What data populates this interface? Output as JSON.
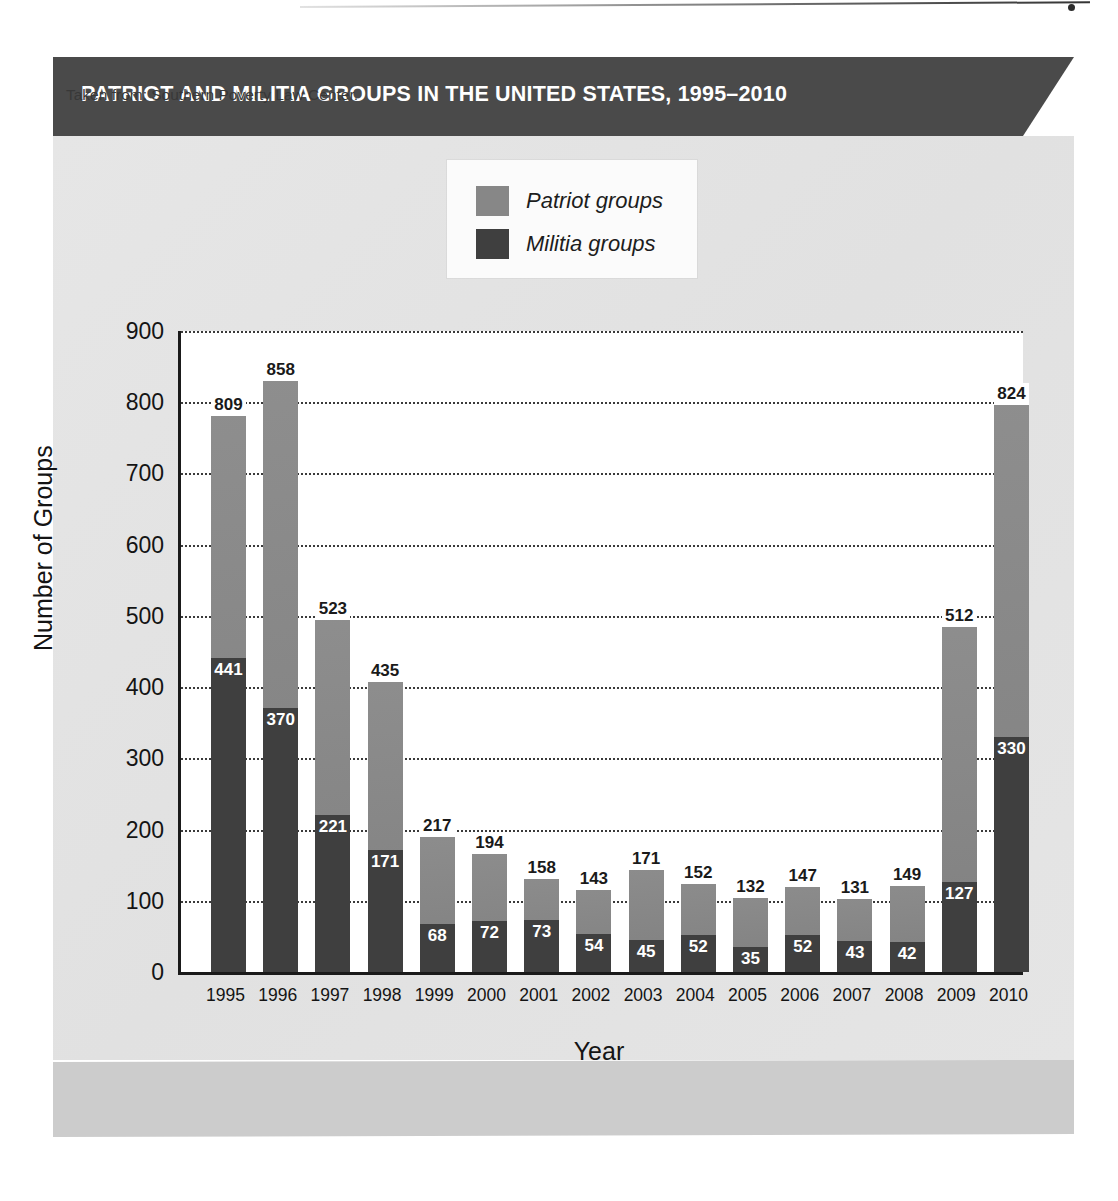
{
  "figure": {
    "title": "PATRIOT AND MILITIA GROUPS IN THE UNITED STATES, 1995–2010",
    "source_note": "Taken from: Southern Poverty Law Center."
  },
  "colors": {
    "banner": "#4a4a4a",
    "panel": "#e4e4e4",
    "footer_band": "#cccccc",
    "patriot": "#878787",
    "militia": "#3f3f3f",
    "plot_background": "#ffffff",
    "axis": "#1a1a1a",
    "gridline": "#3a3a3a"
  },
  "chart_data": {
    "type": "bar",
    "subtype": "stacked",
    "title": "PATRIOT AND MILITIA GROUPS IN THE UNITED STATES, 1995–2010",
    "xlabel": "Year",
    "ylabel": "Number of Groups",
    "ylim": [
      0,
      900
    ],
    "ytick_step": 100,
    "yticks": [
      0,
      100,
      200,
      300,
      400,
      500,
      600,
      700,
      800,
      900
    ],
    "grid": true,
    "grid_axis": "y",
    "grid_style": "dotted",
    "legend_position": "top-center",
    "categories": [
      "1995",
      "1996",
      "1997",
      "1998",
      "1999",
      "2000",
      "2001",
      "2002",
      "2003",
      "2004",
      "2005",
      "2006",
      "2007",
      "2008",
      "2009",
      "2010"
    ],
    "series": [
      {
        "name": "Patriot groups",
        "color": "#878787",
        "note": "Total bar height; value label shown at top of bar",
        "values": [
          809,
          858,
          523,
          435,
          217,
          194,
          158,
          143,
          171,
          152,
          132,
          147,
          131,
          149,
          512,
          824
        ]
      },
      {
        "name": "Militia groups",
        "color": "#3f3f3f",
        "note": "Lower sub-segment of each bar; value label in white inside segment",
        "values": [
          441,
          370,
          221,
          171,
          68,
          72,
          73,
          54,
          45,
          52,
          35,
          52,
          43,
          42,
          127,
          330
        ]
      }
    ]
  },
  "legend": {
    "items": [
      {
        "label": "Patriot groups",
        "color": "#878787"
      },
      {
        "label": "Militia groups",
        "color": "#3f3f3f"
      }
    ]
  }
}
